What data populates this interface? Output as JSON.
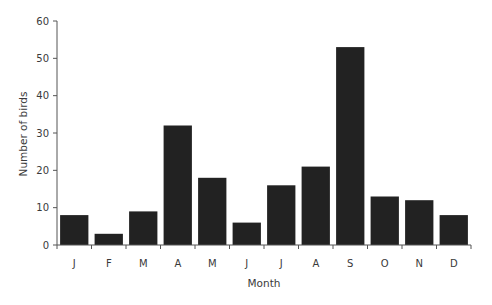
{
  "chart_data": {
    "type": "bar",
    "title": "",
    "xlabel": "Month",
    "ylabel": "Number of birds",
    "categories": [
      "J",
      "F",
      "M",
      "A",
      "M",
      "J",
      "J",
      "A",
      "S",
      "O",
      "N",
      "D"
    ],
    "values": [
      8,
      3,
      9,
      32,
      18,
      6,
      16,
      21,
      53,
      13,
      12,
      8
    ],
    "ylim": [
      0,
      60
    ],
    "yticks": [
      0,
      10,
      20,
      30,
      40,
      50,
      60
    ],
    "grid": false,
    "legend": null,
    "bar_color": "#222222"
  }
}
